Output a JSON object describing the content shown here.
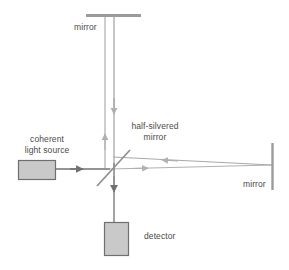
{
  "diagram": {
    "colors": {
      "beam_light": "#b0b0b0",
      "beam_dark": "#808080",
      "component_stroke": "#8a8a8a",
      "component_fill": "#c8c8c8",
      "text": "#4a4a4a",
      "background": "#ffffff"
    },
    "labels": {
      "mirror_top": "mirror",
      "coherent_light_source": "coherent\nlight source",
      "coherent_light_source_line1": "coherent",
      "coherent_light_source_line2": "light source",
      "half_silvered_mirror": "half-silvered\nmirror",
      "half_silvered_mirror_line1": "half-silvered",
      "half_silvered_mirror_line2": "mirror",
      "mirror_right": "mirror",
      "detector": "detector"
    },
    "components": [
      {
        "name": "mirror-top",
        "type": "mirror",
        "label": "mirror"
      },
      {
        "name": "mirror-right",
        "type": "mirror",
        "label": "mirror"
      },
      {
        "name": "beam-splitter",
        "type": "half-silvered-mirror",
        "label": "half-silvered mirror"
      },
      {
        "name": "coherent-light-source",
        "type": "source",
        "label": "coherent light source"
      },
      {
        "name": "detector",
        "type": "detector",
        "label": "detector"
      }
    ],
    "beams": [
      {
        "name": "source-to-splitter",
        "direction": "right"
      },
      {
        "name": "splitter-to-top-mirror",
        "direction": "up"
      },
      {
        "name": "top-mirror-to-splitter",
        "direction": "down"
      },
      {
        "name": "splitter-to-right-mirror",
        "direction": "right"
      },
      {
        "name": "right-mirror-to-splitter",
        "direction": "left"
      },
      {
        "name": "splitter-to-detector",
        "direction": "down"
      }
    ]
  }
}
